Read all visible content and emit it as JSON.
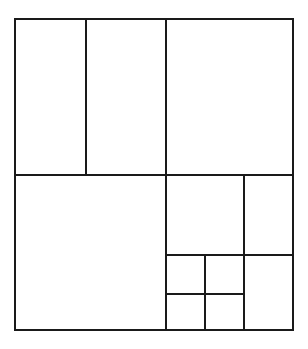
{
  "diagram": {
    "title": "",
    "stroke_color": "#1a1a1a",
    "background": "#ffffff",
    "outer": {
      "x": 15,
      "y": 19,
      "width": 278,
      "height": 311
    },
    "segments": [
      {
        "id": "v-top-left",
        "x1": 86,
        "y1": 19,
        "x2": 86,
        "y2": 175
      },
      {
        "id": "v-center",
        "x1": 166,
        "y1": 19,
        "x2": 166,
        "y2": 330
      },
      {
        "id": "h-middle",
        "x1": 15,
        "y1": 175,
        "x2": 293,
        "y2": 175
      },
      {
        "id": "v-right-inner",
        "x1": 244,
        "y1": 175,
        "x2": 244,
        "y2": 330
      },
      {
        "id": "h-lower-right",
        "x1": 166,
        "y1": 255,
        "x2": 293,
        "y2": 255
      },
      {
        "id": "v-small",
        "x1": 205,
        "y1": 255,
        "x2": 205,
        "y2": 330
      },
      {
        "id": "h-small",
        "x1": 166,
        "y1": 294,
        "x2": 244,
        "y2": 294
      }
    ]
  }
}
